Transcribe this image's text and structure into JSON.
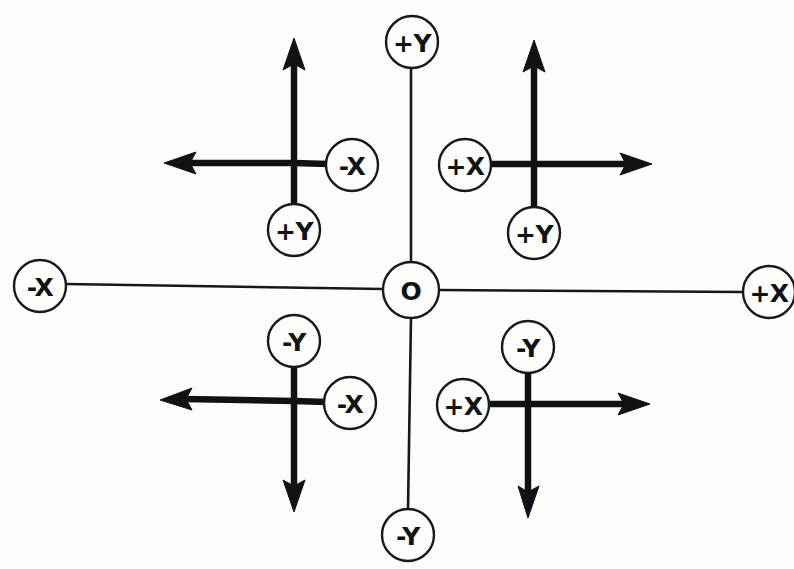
{
  "canvas": {
    "width": 794,
    "height": 569,
    "background": "#fdfdfc",
    "ink": "#17181a"
  },
  "diagram": {
    "kind": "coordinate-axes-schematic",
    "origin": {
      "label": "O",
      "cx": 411,
      "cy": 290,
      "r": 28
    },
    "global_axes": [
      {
        "id": "global-axis-up",
        "label": "+Y",
        "direction": "up",
        "cx": 412,
        "cy": 42,
        "r": 26,
        "line": {
          "x1": 411,
          "y1": 68,
          "x2": 411,
          "y2": 262
        }
      },
      {
        "id": "global-axis-down",
        "label": "-Y",
        "direction": "down",
        "cx": 408,
        "cy": 535,
        "r": 26,
        "line": {
          "x1": 411,
          "y1": 318,
          "x2": 408,
          "y2": 509
        }
      },
      {
        "id": "global-axis-left",
        "label": "-X",
        "direction": "left",
        "cx": 40,
        "cy": 286,
        "r": 26,
        "line": {
          "x1": 66,
          "y1": 284,
          "x2": 383,
          "y2": 289
        }
      },
      {
        "id": "global-axis-right",
        "label": "+X",
        "direction": "right",
        "cx": 769,
        "cy": 292,
        "r": 26,
        "line": {
          "x1": 439,
          "y1": 290,
          "x2": 743,
          "y2": 292
        }
      }
    ],
    "frames": [
      {
        "id": "frame-top-left",
        "quadrant": "top-left",
        "cx": 294,
        "cy": 163,
        "vectors": [
          {
            "id": "vector-up",
            "direction": "up",
            "tip_x": 294,
            "tip_y": 38
          },
          {
            "id": "vector-left",
            "direction": "left",
            "tip_x": 164,
            "tip_y": 163
          }
        ],
        "stubs": [
          {
            "direction": "right",
            "length": 34
          },
          {
            "direction": "down",
            "length": 42
          }
        ],
        "nodes": [
          {
            "id": "node-x",
            "label": "-X",
            "cx": 352,
            "cy": 165,
            "r": 26
          },
          {
            "id": "node-y",
            "label": "+Y",
            "cx": 294,
            "cy": 230,
            "r": 26
          }
        ]
      },
      {
        "id": "frame-top-right",
        "quadrant": "top-right",
        "cx": 534,
        "cy": 164,
        "vectors": [
          {
            "id": "vector-up",
            "direction": "up",
            "tip_x": 534,
            "tip_y": 40
          },
          {
            "id": "vector-right",
            "direction": "right",
            "tip_x": 652,
            "tip_y": 164
          }
        ],
        "stubs": [
          {
            "direction": "left",
            "length": 42
          },
          {
            "direction": "down",
            "length": 42
          }
        ],
        "nodes": [
          {
            "id": "node-x",
            "label": "+X",
            "cx": 465,
            "cy": 165,
            "r": 26
          },
          {
            "id": "node-y",
            "label": "+Y",
            "cx": 534,
            "cy": 233,
            "r": 26
          }
        ]
      },
      {
        "id": "frame-bottom-left",
        "quadrant": "bottom-left",
        "cx": 294,
        "cy": 402,
        "vectors": [
          {
            "id": "vector-left",
            "direction": "left",
            "tip_x": 160,
            "tip_y": 400
          },
          {
            "id": "vector-down",
            "direction": "down",
            "tip_x": 294,
            "tip_y": 512
          }
        ],
        "stubs": [
          {
            "direction": "right",
            "length": 32
          },
          {
            "direction": "up",
            "length": 40
          }
        ],
        "nodes": [
          {
            "id": "node-y",
            "label": "-Y",
            "cx": 294,
            "cy": 341,
            "r": 26
          },
          {
            "id": "node-x",
            "label": "-X",
            "cx": 350,
            "cy": 403,
            "r": 26
          }
        ]
      },
      {
        "id": "frame-bottom-right",
        "quadrant": "bottom-right",
        "cx": 528,
        "cy": 405,
        "vectors": [
          {
            "id": "vector-right",
            "direction": "right",
            "tip_x": 650,
            "tip_y": 404
          },
          {
            "id": "vector-down",
            "direction": "down",
            "tip_x": 528,
            "tip_y": 518
          }
        ],
        "stubs": [
          {
            "direction": "left",
            "length": 40
          },
          {
            "direction": "up",
            "length": 40
          }
        ],
        "nodes": [
          {
            "id": "node-y",
            "label": "-Y",
            "cx": 528,
            "cy": 347,
            "r": 26
          },
          {
            "id": "node-x",
            "label": "+X",
            "cx": 463,
            "cy": 405,
            "r": 26
          }
        ]
      }
    ]
  },
  "labels": {
    "origin": "O",
    "plus_x": "+X",
    "minus_x": "-X",
    "plus_y": "+Y",
    "minus_y": "-Y"
  }
}
